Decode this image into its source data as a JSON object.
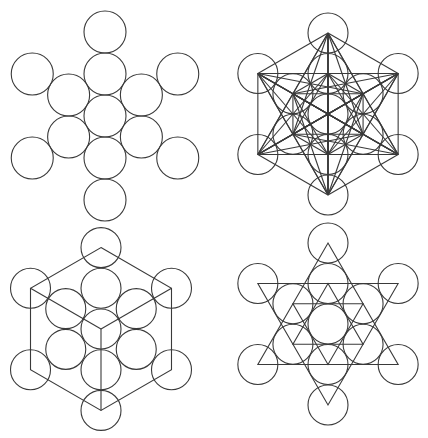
{
  "canvas": {
    "width": 428,
    "height": 438,
    "background": "#ffffff",
    "stroke": "#3a3a3a"
  },
  "figures": [
    {
      "id": "fruit-of-life",
      "label": "Fruit of Life (13 circles)",
      "center": [
        105,
        116
      ],
      "spacing": 42,
      "radius": 21,
      "circles": "all13",
      "overlay": "none"
    },
    {
      "id": "metatrons-cube",
      "label": "Metatron's Cube",
      "center": [
        328,
        114
      ],
      "spacing": 40.5,
      "radius": 20,
      "circles": "all13",
      "overlay": "all-pairs"
    },
    {
      "id": "hexagon-cube",
      "label": "Fruit of Life with hexagon cube",
      "center": [
        101,
        329
      ],
      "spacing": 40.7,
      "radius": 20,
      "circles": "all13",
      "overlay": "hexagon-cube"
    },
    {
      "id": "star-tetrahedron",
      "label": "Fruit of Life with double star",
      "center": [
        328,
        324
      ],
      "spacing": 40.5,
      "radius": 20,
      "circles": "all13-overlay",
      "overlay": "double-star"
    }
  ]
}
